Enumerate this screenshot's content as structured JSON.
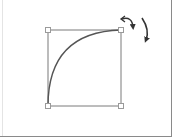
{
  "diagram": {
    "type": "shape-rotate-illustration",
    "shape": {
      "kind": "quarter-arc-in-bounding-box",
      "box": {
        "x1": 48,
        "y1": 30,
        "x2": 121,
        "y2": 106
      },
      "handles": [
        "top-left",
        "top-right",
        "bottom-left",
        "bottom-right"
      ],
      "stroke_color": "#6e6e6e",
      "arc_color": "#555555",
      "handle_fill": "#ffffff",
      "handle_stroke": "#9a9a9a"
    },
    "icons": [
      {
        "name": "rotate-left-arrow-icon",
        "color": "#333333"
      },
      {
        "name": "rotate-right-arrow-icon",
        "color": "#333333"
      }
    ],
    "frame_color": "#8a8a8a"
  }
}
